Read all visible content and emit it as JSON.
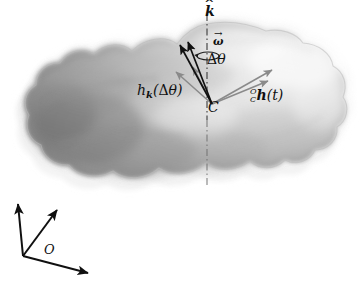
{
  "figure": {
    "name": "rigid-body-angular-momentum-diagram",
    "background_color": "#ffffff",
    "width": 361,
    "height": 284
  },
  "body_shape": {
    "name": "amoeba-rigid-body",
    "description": "irregular lobed blob rendered with airbrush shading, dark at left and lower-left edges, light at upper right",
    "fill_dark": "#6f6f6f",
    "fill_mid": "#9d9d9d",
    "fill_light": "#eeeeee",
    "ghost_outline_color": "#e9e9e9"
  },
  "axis": {
    "name": "rotation-axis",
    "style": "dash-dot",
    "color": "#3a3a3a",
    "x": 207,
    "y_top": 14,
    "y_bottom": 186
  },
  "labels": {
    "k_hat": {
      "text": "k",
      "accent": "^"
    },
    "omega": {
      "text": "ω",
      "accent": "→"
    },
    "delta_theta": {
      "delta": "Δ",
      "theta": "θ"
    },
    "h_k": {
      "h": "h",
      "sub": "k",
      "open": "(",
      "delta": "Δ",
      "theta": "θ",
      "close": ")"
    },
    "center": {
      "text": "C"
    },
    "h_of_t": {
      "pre_sup": "O",
      "pre_sub": "C",
      "h": "h",
      "open": "(",
      "t": "t",
      "close": ")"
    },
    "frame_origin": {
      "text": "O"
    }
  },
  "vectors": {
    "dark_arrows": [
      {
        "name": "h-k-delta-theta-arrow-1",
        "color": "#101010",
        "x1": 212,
        "y1": 104,
        "x2": 180,
        "y2": 45
      },
      {
        "name": "h-k-delta-theta-arrow-2",
        "color": "#101010",
        "x1": 212,
        "y1": 104,
        "x2": 188,
        "y2": 42
      }
    ],
    "grey_arrows": [
      {
        "name": "grey-arrow-up-left-1",
        "color": "#8a8a8a",
        "x1": 212,
        "y1": 104,
        "x2": 176,
        "y2": 72
      },
      {
        "name": "grey-arrow-up-left-2",
        "color": "#8a8a8a",
        "x1": 212,
        "y1": 104,
        "x2": 193,
        "y2": 67
      },
      {
        "name": "h-of-t-arrow-1",
        "color": "#8a8a8a",
        "x1": 212,
        "y1": 104,
        "x2": 272,
        "y2": 70
      },
      {
        "name": "h-of-t-arrow-2",
        "color": "#8a8a8a",
        "x1": 212,
        "y1": 104,
        "x2": 268,
        "y2": 81
      }
    ],
    "rotation_ellipse": {
      "name": "omega-rotation-ellipse",
      "cx": 208,
      "cy": 56,
      "rx": 11,
      "ry": 4,
      "color": "#1a1a1a"
    }
  },
  "reference_frame": {
    "name": "world-frame-O",
    "color": "#101010",
    "origin": {
      "x": 23,
      "y": 256
    },
    "axes": [
      {
        "name": "frame-axis-up",
        "x2": 18,
        "y2": 204
      },
      {
        "name": "frame-axis-diagonal",
        "x2": 57,
        "y2": 210
      },
      {
        "name": "frame-axis-down-right",
        "x2": 88,
        "y2": 273
      }
    ]
  }
}
